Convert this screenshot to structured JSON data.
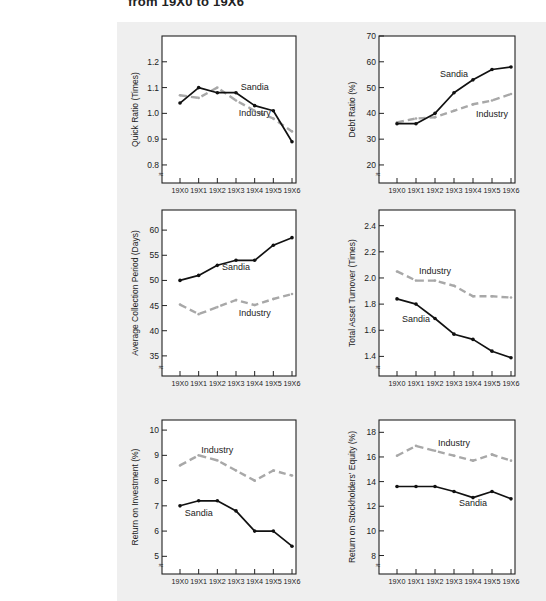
{
  "title": "from 19X0 to 19X6",
  "colors": {
    "sandia": "#111111",
    "industry": "#a8a8a8",
    "panel_bg": "#efefef",
    "plot_bg": "#ffffff"
  },
  "chart_data": [
    {
      "type": "line",
      "id": "quick-ratio",
      "title": "",
      "xlabel": "",
      "ylabel": "Quick Ratio (Times)",
      "categories": [
        "19X0",
        "19X1",
        "19X2",
        "19X3",
        "19X4",
        "19X5",
        "19X6"
      ],
      "yticks": [
        0.8,
        0.9,
        1.0,
        1.1,
        1.2
      ],
      "ytick_labels": [
        "0.8",
        "0.9",
        "1.0",
        "1.1",
        "1.2"
      ],
      "ylim": [
        0.73,
        1.3
      ],
      "axis_break": true,
      "series": [
        {
          "name": "Sandia",
          "style": "solid",
          "values": [
            1.04,
            1.1,
            1.08,
            1.08,
            1.03,
            1.01,
            0.89
          ]
        },
        {
          "name": "Industry",
          "style": "dashed",
          "values": [
            1.07,
            1.06,
            1.1,
            1.05,
            1.01,
            0.98,
            0.93
          ]
        }
      ],
      "annotations": [
        {
          "text": "Sandia",
          "x": "19X4",
          "y": 1.09
        },
        {
          "text": "Industry",
          "x": "19X4",
          "y": 0.99
        }
      ]
    },
    {
      "type": "line",
      "id": "debt-ratio",
      "ylabel": "Debt Ratio (%)",
      "categories": [
        "19X0",
        "19X1",
        "19X2",
        "19X3",
        "19X4",
        "19X5",
        "19X6"
      ],
      "yticks": [
        20,
        30,
        40,
        50,
        60,
        70
      ],
      "ytick_labels": [
        "20",
        "30",
        "40",
        "50",
        "60",
        "70"
      ],
      "ylim": [
        13,
        70
      ],
      "axis_break": true,
      "series": [
        {
          "name": "Sandia",
          "style": "solid",
          "values": [
            36,
            36,
            40,
            48,
            53,
            57,
            58
          ]
        },
        {
          "name": "Industry",
          "style": "dashed",
          "values": [
            36.5,
            38,
            38.5,
            41,
            43.5,
            45,
            47.5
          ]
        }
      ],
      "annotations": [
        {
          "text": "Sandia",
          "x": "19X3",
          "y": 54
        },
        {
          "text": "Industry",
          "x": "19X5",
          "y": 38.5
        }
      ]
    },
    {
      "type": "line",
      "id": "average-collection-period",
      "ylabel": "Average Collection Period (Days)",
      "categories": [
        "19X0",
        "19X1",
        "19X2",
        "19X3",
        "19X4",
        "19X5",
        "19X6"
      ],
      "yticks": [
        35,
        40,
        45,
        50,
        55,
        60
      ],
      "ytick_labels": [
        "35",
        "40",
        "45",
        "50",
        "55",
        "60"
      ],
      "ylim": [
        31,
        64
      ],
      "axis_break": true,
      "series": [
        {
          "name": "Sandia",
          "style": "solid",
          "values": [
            50,
            51,
            53,
            54,
            54,
            57,
            58.5
          ]
        },
        {
          "name": "Industry",
          "style": "dashed",
          "values": [
            45.2,
            43.3,
            44.7,
            46.1,
            45.1,
            46.3,
            47.3
          ]
        }
      ],
      "annotations": [
        {
          "text": "Sandia",
          "x": "19X3",
          "y": 52
        },
        {
          "text": "Industry",
          "x": "19X4",
          "y": 43
        }
      ]
    },
    {
      "type": "line",
      "id": "total-asset-turnover",
      "ylabel": "Total Asset Turnover (Times)",
      "categories": [
        "19X0",
        "19X1",
        "19X2",
        "19X3",
        "19X4",
        "19X5",
        "19X6"
      ],
      "yticks": [
        1.4,
        1.6,
        1.8,
        2.0,
        2.2,
        2.4
      ],
      "ytick_labels": [
        "1.4",
        "1.6",
        "1.8",
        "2.0",
        "2.2",
        "2.4"
      ],
      "ylim": [
        1.25,
        2.52
      ],
      "axis_break": true,
      "series": [
        {
          "name": "Sandia",
          "style": "solid",
          "values": [
            1.84,
            1.8,
            1.69,
            1.57,
            1.53,
            1.44,
            1.39
          ]
        },
        {
          "name": "Industry",
          "style": "dashed",
          "values": [
            2.05,
            1.98,
            1.98,
            1.94,
            1.86,
            1.86,
            1.85
          ]
        }
      ],
      "annotations": [
        {
          "text": "Industry",
          "x": "19X2",
          "y": 2.03
        },
        {
          "text": "Sandia",
          "x": "19X1",
          "y": 1.66
        }
      ]
    },
    {
      "type": "line",
      "id": "return-on-investment",
      "ylabel": "Return on Investment (%)",
      "categories": [
        "19X0",
        "19X1",
        "19X2",
        "19X3",
        "19X4",
        "19X5",
        "19X6"
      ],
      "yticks": [
        5,
        6,
        7,
        8,
        9,
        10
      ],
      "ytick_labels": [
        "5",
        "6",
        "7",
        "8",
        "9",
        "10"
      ],
      "ylim": [
        4.3,
        10.4
      ],
      "axis_break": true,
      "series": [
        {
          "name": "Sandia",
          "style": "solid",
          "values": [
            7.0,
            7.2,
            7.2,
            6.8,
            6.0,
            6.0,
            5.4
          ]
        },
        {
          "name": "Industry",
          "style": "dashed",
          "values": [
            8.6,
            9.0,
            8.8,
            8.4,
            8.0,
            8.4,
            8.2
          ]
        }
      ],
      "annotations": [
        {
          "text": "Industry",
          "x": "19X2",
          "y": 9.1
        },
        {
          "text": "Sandia",
          "x": "19X1",
          "y": 6.6
        }
      ]
    },
    {
      "type": "line",
      "id": "return-on-stockholders-equity",
      "ylabel": "Return on Stockholders' Equity (%)",
      "categories": [
        "19X0",
        "19X1",
        "19X2",
        "19X3",
        "19X4",
        "19X5",
        "19X6"
      ],
      "yticks": [
        8,
        10,
        12,
        14,
        16,
        18
      ],
      "ytick_labels": [
        "8",
        "10",
        "12",
        "14",
        "16",
        "18"
      ],
      "ylim": [
        6.5,
        19
      ],
      "axis_break": true,
      "series": [
        {
          "name": "Sandia",
          "style": "solid",
          "values": [
            13.6,
            13.6,
            13.6,
            13.2,
            12.7,
            13.2,
            12.6
          ]
        },
        {
          "name": "Industry",
          "style": "dashed",
          "values": [
            16.1,
            16.9,
            16.5,
            16.1,
            15.7,
            16.2,
            15.7
          ]
        }
      ],
      "annotations": [
        {
          "text": "Industry",
          "x": "19X3",
          "y": 16.9
        },
        {
          "text": "Sandia",
          "x": "19X4",
          "y": 12.0
        }
      ]
    }
  ]
}
